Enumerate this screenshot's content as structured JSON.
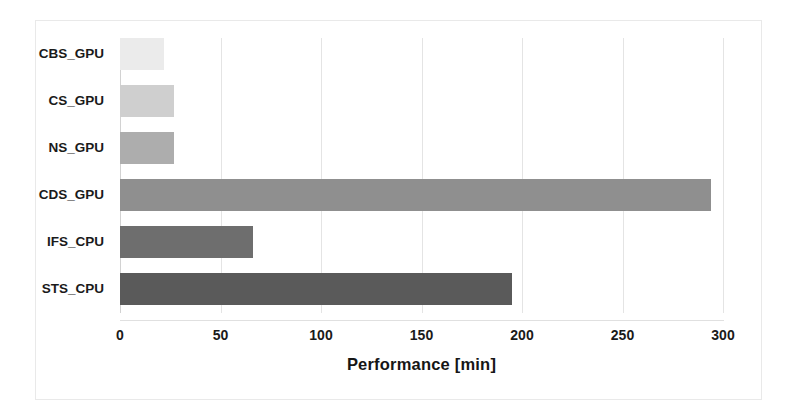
{
  "chart_data": {
    "type": "bar",
    "orientation": "horizontal",
    "title": "",
    "xlabel": "Performance [min]",
    "ylabel": "",
    "categories": [
      "CBS_GPU",
      "CS_GPU",
      "NS_GPU",
      "CDS_GPU",
      "IFS_CPU",
      "STS_CPU"
    ],
    "values": [
      22,
      27,
      27,
      294,
      66,
      195
    ],
    "xlim": [
      0,
      300
    ],
    "xticks": [
      0,
      50,
      100,
      150,
      200,
      250,
      300
    ],
    "xtick_labels": [
      "0",
      "50",
      "100",
      "150",
      "200",
      "250",
      "300"
    ],
    "grid": "vertical",
    "legend": "none",
    "bar_colors": [
      "#ebebeb",
      "#cfcfcf",
      "#adadad",
      "#8f8f8f",
      "#6e6e6e",
      "#5a5a5a"
    ],
    "bars": [
      {
        "label": "CBS_GPU",
        "value": 22,
        "color": "#ebebeb"
      },
      {
        "label": "CS_GPU",
        "value": 27,
        "color": "#cfcfcf"
      },
      {
        "label": "NS_GPU",
        "value": 27,
        "color": "#adadad"
      },
      {
        "label": "CDS_GPU",
        "value": 294,
        "color": "#8f8f8f"
      },
      {
        "label": "IFS_CPU",
        "value": 66,
        "color": "#6e6e6e"
      },
      {
        "label": "STS_CPU",
        "value": 195,
        "color": "#5a5a5a"
      }
    ]
  },
  "figure": {
    "background_color": "#ffffff",
    "frame_color": "#e9e9e9",
    "gridline_color": "#e4e4e4"
  }
}
